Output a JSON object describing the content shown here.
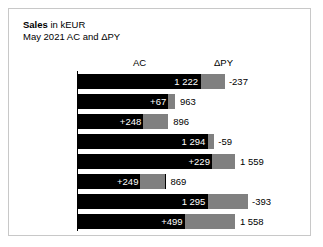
{
  "title": {
    "line1_strong": "Sales",
    "line1_rest": " in kEUR",
    "line2": "May 2021 AC and ΔPY"
  },
  "headers": {
    "ac": "AC",
    "dpy": "ΔPY"
  },
  "colors": {
    "ac_bar": "#000000",
    "delta_bar": "#808080",
    "frame": "#c8c8c8",
    "text": "#000000",
    "label_on_bar": "#ffffff"
  },
  "chart_data": {
    "type": "bar",
    "title": "Sales in kEUR",
    "subtitle": "May 2021 AC and ΔPY",
    "xlabel": "",
    "ylabel": "",
    "orientation": "horizontal",
    "grid": false,
    "legend": false,
    "axis_position": "left",
    "categories": [
      "Berlin",
      "Paris",
      "Rome",
      "NYC",
      "Vienna",
      "Stockholm",
      "Berne",
      "London"
    ],
    "series": [
      {
        "name": "AC",
        "values": [
          1222,
          963,
          896,
          1294,
          1559,
          869,
          1295,
          1558
        ]
      },
      {
        "name": "ΔPY",
        "values": [
          -237,
          67,
          248,
          -59,
          229,
          249,
          -393,
          499
        ]
      }
    ],
    "ac_labels": [
      "1 222",
      "963",
      "896",
      "1 294",
      "1 559",
      "869",
      "1 295",
      "1 558"
    ],
    "delta_labels": [
      "-237",
      "+67",
      "+248",
      "-59",
      "+229",
      "+249",
      "-393",
      "+499"
    ],
    "xlim": [
      0,
      1952
    ],
    "px_per_unit": 0.1007,
    "rows": [
      {
        "city": "Berlin",
        "ac": 1222,
        "delta": -237,
        "ac_label": "1 222",
        "delta_label": "-237",
        "ac_label_inside": true,
        "delta_label_inside": false
      },
      {
        "city": "Paris",
        "ac": 963,
        "delta": 67,
        "ac_label": "963",
        "delta_label": "+67",
        "ac_label_inside": false,
        "delta_label_inside": true
      },
      {
        "city": "Rome",
        "ac": 896,
        "delta": 248,
        "ac_label": "896",
        "delta_label": "+248",
        "ac_label_inside": false,
        "delta_label_inside": true
      },
      {
        "city": "NYC",
        "ac": 1294,
        "delta": -59,
        "ac_label": "1 294",
        "delta_label": "-59",
        "ac_label_inside": true,
        "delta_label_inside": false
      },
      {
        "city": "Vienna",
        "ac": 1559,
        "delta": 229,
        "ac_label": "1 559",
        "delta_label": "+229",
        "ac_label_inside": false,
        "delta_label_inside": true
      },
      {
        "city": "Stockholm",
        "ac": 869,
        "delta": 249,
        "ac_label": "869",
        "delta_label": "+249",
        "ac_label_inside": false,
        "delta_label_inside": true
      },
      {
        "city": "Berne",
        "ac": 1295,
        "delta": -393,
        "ac_label": "1 295",
        "delta_label": "-393",
        "ac_label_inside": true,
        "delta_label_inside": false
      },
      {
        "city": "London",
        "ac": 1558,
        "delta": 499,
        "ac_label": "1 558",
        "delta_label": "+499",
        "ac_label_inside": false,
        "delta_label_inside": true
      }
    ]
  }
}
